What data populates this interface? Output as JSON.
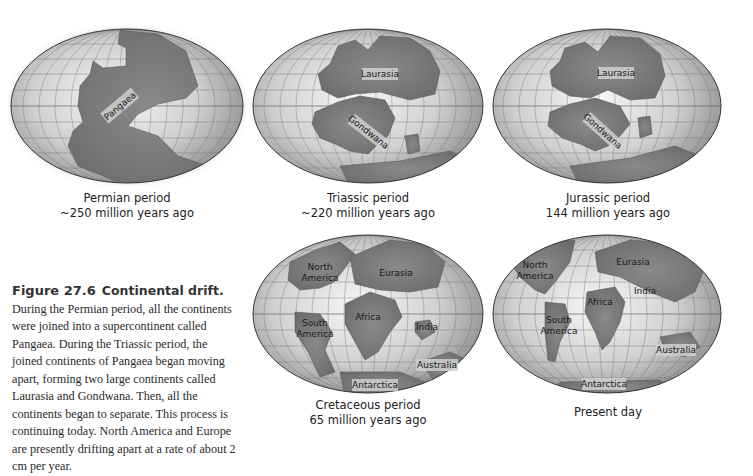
{
  "figure": {
    "number": "Figure 27.6",
    "title": "Continental drift.",
    "caption": "During the Permian period, all the continents were joined into a supercontinent called Pangaea. During the Triassic period, the joined continents of Pangaea began moving apart, forming two large continents called Laurasia and Gondwana. Then, all the continents began to separate. This process is continuing today. North America and Europe are presently drifting apart at a rate of about 2 cm per year."
  },
  "maps": [
    {
      "id": "permian",
      "period": "Permian period",
      "age": "~250 million years ago",
      "labels": [
        "Pangaea"
      ]
    },
    {
      "id": "triassic",
      "period": "Triassic period",
      "age": "~220 million years ago",
      "labels": [
        "Laurasia",
        "Gondwana"
      ]
    },
    {
      "id": "jurassic",
      "period": "Jurassic period",
      "age": "144 million years ago",
      "labels": [
        "Laurasia",
        "Gondwana"
      ]
    },
    {
      "id": "cretaceous",
      "period": "Cretaceous period",
      "age": "65 million years ago",
      "labels": [
        "North",
        "America",
        "Eurasia",
        "Africa",
        "South",
        "America",
        "India",
        "Australia",
        "Antarctica"
      ]
    },
    {
      "id": "present",
      "period": "Present day",
      "age": "",
      "labels": [
        "North",
        "America",
        "Eurasia",
        "Africa",
        "India",
        "South",
        "America",
        "Australia",
        "Antarctica"
      ]
    }
  ],
  "colors": {
    "ocean_light": "#f2f2f2",
    "ocean_dark": "#9a9a9a",
    "land": "#7d7d7d",
    "land_edge": "#5e5e5e",
    "grid": "#555555",
    "outline": "#333333"
  }
}
